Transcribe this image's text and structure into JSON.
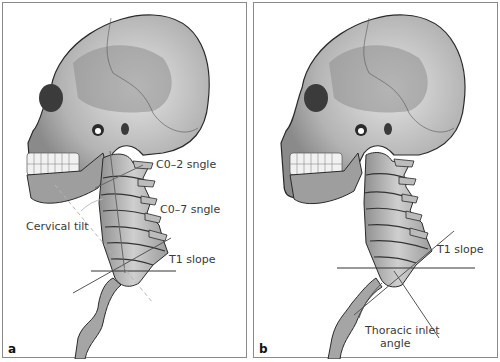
{
  "figure": {
    "panels": [
      {
        "id": "a",
        "letter": "a",
        "labels": {
          "c02": "C0–2 sngle",
          "c07": "C0–7 sngle",
          "cervical_tilt": "Cervical tilt",
          "t1_slope": "T1 slope"
        }
      },
      {
        "id": "b",
        "letter": "b",
        "labels": {
          "t1_slope": "T1 slope",
          "thoracic_inlet_line1": "Thoracic inlet",
          "thoracic_inlet_line2": "angle"
        }
      }
    ],
    "colors": {
      "bone_light": "#d9d9d9",
      "bone_mid": "#a8a8a8",
      "bone_dark": "#6a6a6a",
      "outline": "#2a2a2a",
      "measure_line": "#555555",
      "dashed_line": "#b5b5b5",
      "border": "#8a8a8a"
    }
  }
}
